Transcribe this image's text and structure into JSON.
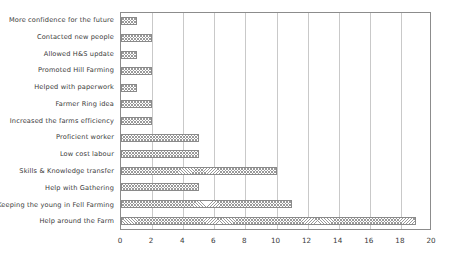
{
  "chart_data": {
    "type": "bar",
    "orientation": "horizontal",
    "title": "",
    "xlabel": "",
    "ylabel": "",
    "xlim": [
      0,
      20
    ],
    "xticks": [
      0,
      2,
      4,
      6,
      8,
      10,
      12,
      14,
      16,
      18,
      20
    ],
    "grid": true,
    "legend": false,
    "bar_color": "#9a9a9a",
    "bar_edge_color": "#8a8a8a",
    "bar_pattern": "crosshatch",
    "frame_color": "#8c8c8c",
    "gridline_color": "#c9c9c9",
    "text_color": "#3a3a3a",
    "categories": [
      "More confidence for the future",
      "Contacted new people",
      "Allowed H&S update",
      "Promoted Hill Farming",
      "Helped with paperwork",
      "Farmer Ring idea",
      "Increased the farms efficiency",
      "Proficient worker",
      "Low cost labour",
      "Skills & Knowledge transfer",
      "Help with Gathering",
      "Keeping the young in Fell Farming",
      "Help around the Farm"
    ],
    "values": [
      1,
      2,
      1,
      2,
      1,
      2,
      2,
      5,
      5,
      10,
      5,
      11,
      19
    ]
  }
}
